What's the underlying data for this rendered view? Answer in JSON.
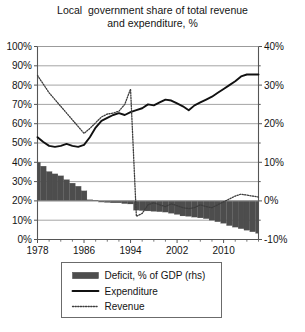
{
  "chart_data": {
    "type": "line",
    "title": "Local  government share of total revenue\nand expenditure, %",
    "title_line1": "Local  government share of total revenue",
    "title_line2": "and expenditure, %",
    "xlabel": "",
    "ylabel": "",
    "grid": true,
    "legend_position": "bottom",
    "x": [
      1978,
      1979,
      1980,
      1981,
      1982,
      1983,
      1984,
      1985,
      1986,
      1987,
      1988,
      1989,
      1990,
      1991,
      1992,
      1993,
      1994,
      1995,
      1996,
      1997,
      1998,
      1999,
      2000,
      2001,
      2002,
      2003,
      2004,
      2005,
      2006,
      2007,
      2008,
      2009,
      2010,
      2011,
      2012,
      2013,
      2014,
      2015,
      2016
    ],
    "xlim": [
      1978,
      2016
    ],
    "xticks": [
      1978,
      1986,
      1994,
      2002,
      2010
    ],
    "xtick_labels": [
      "1978",
      "1986",
      "1994",
      "2002",
      "2010"
    ],
    "ylim": [
      0,
      100
    ],
    "yticks": [
      0,
      10,
      20,
      30,
      40,
      50,
      60,
      70,
      80,
      90,
      100
    ],
    "ytick_labels": [
      "0%",
      "10%",
      "20%",
      "30%",
      "40%",
      "50%",
      "60%",
      "70%",
      "80%",
      "90%",
      "100%"
    ],
    "y2lim": [
      -10,
      40
    ],
    "y2ticks": [
      -10,
      0,
      10,
      20,
      30,
      40
    ],
    "y2tick_labels": [
      "-10%",
      "0%",
      "10%",
      "20%",
      "30%",
      "40%"
    ],
    "y2minor_step": 5,
    "series": [
      {
        "name": "Deficit, % of GDP (rhs)",
        "type": "bar",
        "axis": "right",
        "color": "#4d4d4d",
        "values": [
          10.0,
          9.0,
          7.6,
          7.0,
          6.5,
          5.5,
          4.6,
          3.8,
          2.6,
          0.3,
          0.1,
          -0.3,
          -0.4,
          -0.5,
          -0.5,
          -0.7,
          -0.8,
          -2.4,
          -2.5,
          -2.6,
          -2.7,
          -2.8,
          -2.9,
          -3.2,
          -3.5,
          -3.9,
          -4.0,
          -4.2,
          -4.4,
          -4.6,
          -5.0,
          -5.4,
          -5.8,
          -6.4,
          -6.8,
          -7.2,
          -7.6,
          -8.0,
          -8.4
        ]
      },
      {
        "name": "Expenditure",
        "type": "line",
        "axis": "left",
        "color": "#111111",
        "style": "solid",
        "values": [
          53.0,
          50.5,
          48.5,
          48.0,
          48.5,
          49.5,
          48.5,
          48.0,
          49.0,
          53.0,
          58.0,
          61.5,
          63.0,
          64.5,
          65.5,
          64.5,
          66.0,
          67.0,
          68.0,
          70.0,
          69.5,
          71.0,
          72.5,
          72.0,
          70.5,
          69.0,
          67.0,
          69.5,
          71.0,
          72.5,
          74.0,
          76.0,
          78.0,
          80.0,
          82.0,
          84.5,
          85.5,
          85.5,
          85.5
        ]
      },
      {
        "name": "Revenue",
        "type": "line",
        "axis": "left",
        "color": "#3d3d3d",
        "style": "dotted",
        "values": [
          85.0,
          80.5,
          76.0,
          72.5,
          69.0,
          65.5,
          62.0,
          58.5,
          55.0,
          57.5,
          60.5,
          63.5,
          65.0,
          65.5,
          66.5,
          70.0,
          78.0,
          12.0,
          13.5,
          18.0,
          19.0,
          18.0,
          17.0,
          18.5,
          17.5,
          16.5,
          16.0,
          16.5,
          18.0,
          17.0,
          16.5,
          18.0,
          19.5,
          21.0,
          22.5,
          23.5,
          23.0,
          22.5,
          22.0
        ]
      }
    ],
    "annotations": []
  },
  "legend": {
    "items": [
      {
        "label": "Deficit, % of GDP (rhs)",
        "marker": "swatch",
        "color": "#4d4d4d"
      },
      {
        "label": "Expenditure",
        "marker": "solid-line",
        "color": "#111111"
      },
      {
        "label": "Revenue",
        "marker": "dotted-line",
        "color": "#3d3d3d"
      }
    ]
  },
  "colors": {
    "bar": "#4d4d4d",
    "expenditure": "#111111",
    "revenue": "#3d3d3d",
    "grid": "#9a9a9a",
    "axis": "#555555",
    "text": "#141414",
    "background": "#ffffff"
  }
}
